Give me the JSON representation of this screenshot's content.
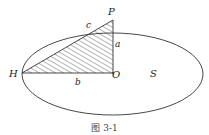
{
  "figure": {
    "caption": "图 3-1",
    "points": {
      "H": "H",
      "O": "O",
      "P": "P"
    },
    "segments": {
      "a": "a",
      "b": "b",
      "c": "c"
    },
    "region_label": "S",
    "colors": {
      "stroke": "#333333",
      "hatch": "#444444",
      "background": "#ffffff"
    }
  }
}
